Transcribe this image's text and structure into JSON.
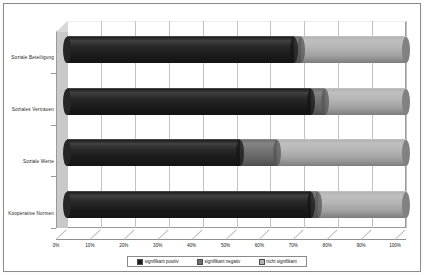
{
  "chart_data": {
    "type": "bar",
    "orientation": "horizontal",
    "stacked": true,
    "style": "3d-cylinder",
    "title": "",
    "xlabel": "",
    "ylabel": "",
    "xlim": [
      0,
      100
    ],
    "grid": true,
    "legend_position": "bottom",
    "categories": [
      "Soziale Beteiligung",
      "Soziales Vertrauen",
      "Soziale Werte",
      "Kooperative Normen"
    ],
    "xtick_labels": [
      "0%",
      "10%",
      "20%",
      "30%",
      "40%",
      "50%",
      "60%",
      "70%",
      "80%",
      "90%",
      "100%"
    ],
    "xtick_values": [
      0,
      10,
      20,
      30,
      40,
      50,
      60,
      70,
      80,
      90,
      100
    ],
    "series": [
      {
        "name": "signifikant positiv",
        "color": "#1c1c1c",
        "values": [
          67,
          72,
          51,
          72
        ]
      },
      {
        "name": "signifikant negativ",
        "color": "#6e6e6e",
        "values": [
          2,
          4,
          11,
          2
        ]
      },
      {
        "name": "nicht signifikant",
        "color": "#b3b3b3",
        "values": [
          31,
          24,
          38,
          26
        ]
      }
    ]
  },
  "colors": {
    "series_positiv": "#1c1c1c",
    "series_negativ": "#6e6e6e",
    "series_nicht": "#b3b3b3",
    "wall": "#ffffff",
    "side_panel": "#c9c9c9",
    "gridline": "#c2c2c2",
    "border": "#8a8a8a",
    "text": "#1a1a1a"
  },
  "legend": {
    "items": [
      {
        "label": "signifikant positiv",
        "swatch": "#1c1c1c"
      },
      {
        "label": "signifikant negativ",
        "swatch": "#6e6e6e"
      },
      {
        "label": "nicht signifikant",
        "swatch": "#b3b3b3"
      }
    ]
  }
}
